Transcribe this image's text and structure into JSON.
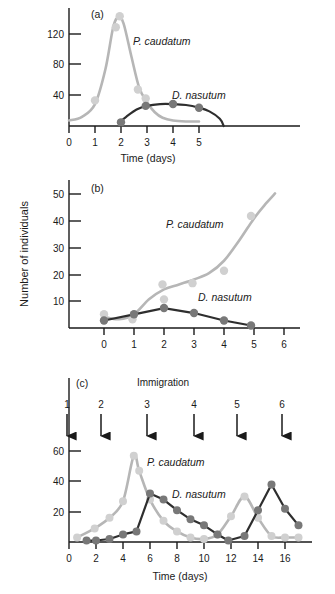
{
  "figure": {
    "ylabel": "Number of individuals",
    "series_names": {
      "prey": "P. caudatum",
      "predator": "D. nasutum"
    },
    "colors": {
      "prey_line": "#b6b6b6",
      "prey_point": "#d0d0d0",
      "predator_line": "#2e2e2e",
      "predator_point": "#787878",
      "axis": "#1a1a1a",
      "background": "#ffffff"
    }
  },
  "panels": [
    {
      "id": "a",
      "letter": "(a)",
      "xlabel": "Time (days)",
      "xticks": [
        "0",
        "1",
        "2",
        "3",
        "4",
        "5"
      ],
      "yticks": [
        "40",
        "80",
        "120"
      ],
      "label_prey": "P. caudatum",
      "label_predator": "D. nasutum"
    },
    {
      "id": "b",
      "letter": "(b)",
      "xlabel": "",
      "xticks": [
        "0",
        "1",
        "2",
        "3",
        "4",
        "5",
        "6"
      ],
      "yticks": [
        "10",
        "20",
        "30",
        "40",
        "50"
      ],
      "label_prey": "P. caudatum",
      "label_predator": "D. nasutum"
    },
    {
      "id": "c",
      "letter": "(c)",
      "xlabel": "Time (days)",
      "xticks": [
        "0",
        "2",
        "4",
        "6",
        "8",
        "10",
        "12",
        "14",
        "16"
      ],
      "yticks": [
        "20",
        "40",
        "60"
      ],
      "label_prey": "P. caudatum",
      "label_predator": "D. nasutum",
      "immigration_title": "Immigration",
      "immigration_labels": [
        "1",
        "2",
        "3",
        "4",
        "5",
        "6"
      ]
    }
  ],
  "chart_data": [
    {
      "type": "scatter",
      "panel": "a",
      "title": "(a)",
      "xlabel": "Time (days)",
      "ylabel": "Number of individuals",
      "xlim": [
        0,
        6.2
      ],
      "ylim": [
        0,
        140
      ],
      "xticks": [
        0,
        1,
        2,
        3,
        4,
        5
      ],
      "yticks": [
        40,
        80,
        120
      ],
      "grid": false,
      "series": [
        {
          "name": "P. caudatum",
          "color": "#b6b6b6",
          "points_x": [
            1.0,
            1.8,
            1.95,
            2.65,
            2.95
          ],
          "points_y": [
            28,
            108,
            120,
            40,
            30
          ],
          "curve_x": [
            0.0,
            0.5,
            1.0,
            1.4,
            1.7,
            1.9,
            2.1,
            2.4,
            2.7,
            3.0,
            3.3,
            3.6,
            4.0,
            4.5,
            5.0
          ],
          "curve_y": [
            6,
            10,
            24,
            62,
            108,
            119,
            112,
            76,
            42,
            26,
            15,
            9,
            6,
            5,
            5
          ]
        },
        {
          "name": "D. nasutum",
          "color": "#2e2e2e",
          "points_x": [
            2.0,
            2.95,
            4.0,
            5.0
          ],
          "points_y": [
            4,
            22,
            24,
            20
          ],
          "curve_x": [
            1.9,
            2.2,
            2.6,
            3.0,
            3.5,
            4.0,
            4.5,
            5.0,
            5.4,
            5.8,
            5.95
          ],
          "curve_y": [
            3,
            10,
            18,
            22,
            24,
            24,
            23,
            20,
            16,
            8,
            0
          ]
        }
      ]
    },
    {
      "type": "scatter",
      "panel": "b",
      "title": "(b)",
      "xlabel": "",
      "ylabel": "Number of individuals",
      "xlim": [
        -0.55,
        6.4
      ],
      "ylim": [
        0,
        55
      ],
      "xticks": [
        0,
        1,
        2,
        3,
        4,
        5,
        6
      ],
      "yticks": [
        10,
        20,
        30,
        40,
        50
      ],
      "grid": false,
      "series": [
        {
          "name": "P. caudatum",
          "color": "#b6b6b6",
          "points_x": [
            0.0,
            0.95,
            1.95,
            2.0,
            2.95,
            4.0,
            4.9
          ],
          "points_y": [
            5.5,
            3.5,
            17.5,
            11.5,
            18,
            23,
            45
          ],
          "curve_x": [
            0.0,
            0.5,
            1.0,
            1.5,
            2.0,
            2.5,
            3.0,
            3.5,
            4.0,
            4.5,
            5.0,
            5.4,
            5.7
          ],
          "curve_y": [
            4.5,
            3.5,
            5.5,
            11.5,
            15.5,
            17.5,
            19.5,
            22,
            27,
            35,
            44,
            50,
            54
          ]
        },
        {
          "name": "D. nasutum",
          "color": "#2e2e2e",
          "points_x": [
            0.0,
            1.0,
            2.0,
            3.0,
            4.0,
            4.9
          ],
          "points_y": [
            3,
            5.5,
            8,
            6,
            3,
            1
          ],
          "curve_x": [
            0.0,
            1.0,
            2.0,
            3.0,
            4.0,
            4.9
          ],
          "curve_y": [
            3,
            5.5,
            8,
            6,
            3,
            1
          ]
        }
      ]
    },
    {
      "type": "scatter",
      "panel": "c",
      "title": "(c)",
      "xlabel": "Time (days)",
      "ylabel": "Number of individuals",
      "xlim": [
        0,
        17.5
      ],
      "ylim": [
        0,
        72
      ],
      "xticks": [
        0,
        2,
        4,
        6,
        8,
        10,
        12,
        14,
        16
      ],
      "yticks": [
        20,
        40,
        60
      ],
      "grid": false,
      "annotations": {
        "immigration_title": "Immigration",
        "arrows_x": [
          0.5,
          3.0,
          6.0,
          9.0,
          11.8,
          14.8
        ],
        "arrow_labels": [
          "1",
          "2",
          "3",
          "4",
          "5",
          "6"
        ]
      },
      "series": [
        {
          "name": "P. caudatum",
          "color": "#b6b6b6",
          "points_x": [
            0.6,
            1.9,
            3.0,
            4.0,
            4.8,
            5.2,
            6.0,
            7.0,
            8.0,
            9.0,
            10.0,
            11.0,
            12.0,
            13.0,
            14.0,
            15.0,
            16.0,
            17.0
          ],
          "points_y": [
            3,
            9,
            16,
            27,
            57,
            47,
            28,
            14,
            7,
            3,
            2,
            5,
            17,
            30,
            16,
            4,
            3,
            3
          ]
        },
        {
          "name": "D. nasutum",
          "color": "#2e2e2e",
          "points_x": [
            1.3,
            2.0,
            3.0,
            4.0,
            5.0,
            6.0,
            7.0,
            8.0,
            9.0,
            10.0,
            11.0,
            11.8,
            13.0,
            14.0,
            15.0,
            16.0,
            17.0
          ],
          "points_y": [
            1,
            1,
            2,
            5,
            7,
            32,
            28,
            21,
            15,
            11,
            5,
            1,
            4,
            21,
            38,
            22,
            11
          ]
        }
      ]
    }
  ]
}
